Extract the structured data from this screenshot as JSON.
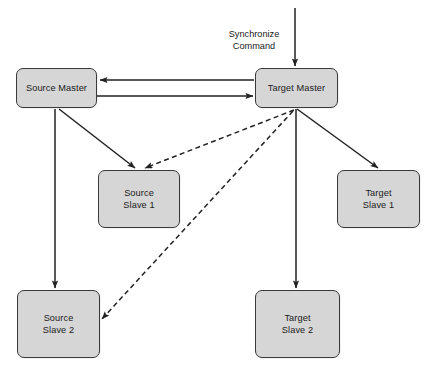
{
  "diagram": {
    "canvas": {
      "width": 434,
      "height": 373
    },
    "colors": {
      "node_fill": "#d6d6d6",
      "node_stroke": "#3a3a3a",
      "edge_solid": "#222222",
      "edge_dashed": "#222222",
      "text": "#1a1a1a",
      "background": "#ffffff"
    },
    "nodes": [
      {
        "id": "source-master",
        "label": "Source Master",
        "x": 16,
        "y": 68,
        "w": 81,
        "h": 40
      },
      {
        "id": "target-master",
        "label": "Target Master",
        "x": 255,
        "y": 68,
        "w": 83,
        "h": 40
      },
      {
        "id": "source-slave-1",
        "label": "Source\nSlave 1",
        "x": 98,
        "y": 170,
        "w": 82,
        "h": 58
      },
      {
        "id": "target-slave-1",
        "label": "Target\nSlave 1",
        "x": 337,
        "y": 170,
        "w": 83,
        "h": 58
      },
      {
        "id": "source-slave-2",
        "label": "Source\nSlave 2",
        "x": 17,
        "y": 290,
        "w": 83,
        "h": 68
      },
      {
        "id": "target-slave-2",
        "label": "Target\nSlave 2",
        "x": 255,
        "y": 290,
        "w": 85,
        "h": 68
      }
    ],
    "edge_labels": [
      {
        "id": "synchronize-command",
        "text": "Synchronize\nCommand",
        "x": 222,
        "y": 16,
        "w": 64
      }
    ],
    "edges": [
      {
        "id": "sync-command-into-target-master",
        "from": "external-input",
        "to": "target-master",
        "style": "solid",
        "arrow": "end"
      },
      {
        "id": "target-master-to-source-master",
        "from": "target-master",
        "to": "source-master",
        "style": "solid",
        "arrow": "end"
      },
      {
        "id": "source-master-to-target-master",
        "from": "source-master",
        "to": "target-master",
        "style": "solid",
        "arrow": "end"
      },
      {
        "id": "source-master-to-source-slave-1",
        "from": "source-master",
        "to": "source-slave-1",
        "style": "solid",
        "arrow": "end"
      },
      {
        "id": "source-master-to-source-slave-2",
        "from": "source-master",
        "to": "source-slave-2",
        "style": "solid",
        "arrow": "end"
      },
      {
        "id": "target-master-to-target-slave-1",
        "from": "target-master",
        "to": "target-slave-1",
        "style": "solid",
        "arrow": "end"
      },
      {
        "id": "target-master-to-target-slave-2",
        "from": "target-master",
        "to": "target-slave-2",
        "style": "solid",
        "arrow": "end"
      },
      {
        "id": "target-master-to-source-slave-1",
        "from": "target-master",
        "to": "source-slave-1",
        "style": "dashed",
        "arrow": "end"
      },
      {
        "id": "target-master-to-source-slave-2",
        "from": "target-master",
        "to": "source-slave-2",
        "style": "dashed",
        "arrow": "end"
      }
    ]
  }
}
